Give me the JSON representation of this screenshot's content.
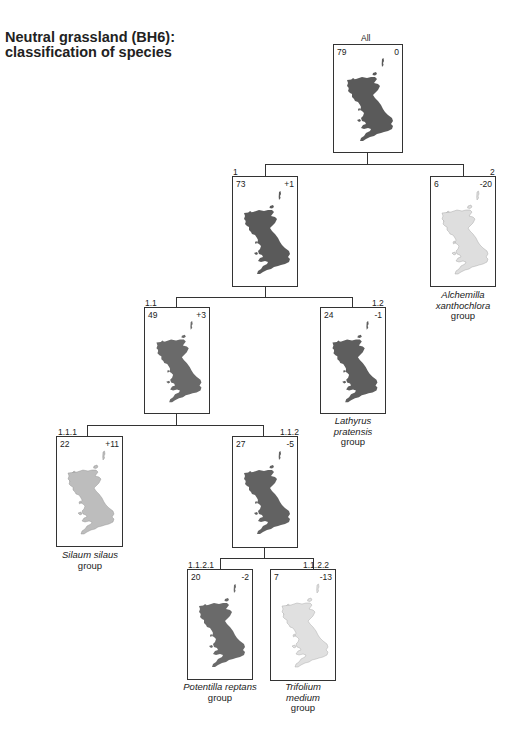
{
  "title": {
    "line1": "Neutral grassland (BH6):",
    "line2": "classification of species"
  },
  "colors": {
    "line": "#333333",
    "box_border": "#333333",
    "map_dark": "#5a5a5a",
    "map_medium": "#808080",
    "map_light": "#c8c8c8",
    "map_very_light": "#e2e2e2"
  },
  "nodes": [
    {
      "id": "All",
      "count": "79",
      "change": "0",
      "species": "",
      "group": "",
      "shade": "dark"
    },
    {
      "id": "1",
      "count": "73",
      "change": "+1",
      "species": "",
      "group": "",
      "shade": "dark"
    },
    {
      "id": "2",
      "count": "6",
      "change": "-20",
      "species": "Alchemilla xanthochlora",
      "species_line1": "Alchemilla",
      "species_line2": "xanthochlora",
      "group": "group",
      "shade": "very_light"
    },
    {
      "id": "1.1",
      "count": "49",
      "change": "+3",
      "species": "",
      "group": "",
      "shade": "medium"
    },
    {
      "id": "1.2",
      "count": "24",
      "change": "-1",
      "species": "Lathyrus pratensis",
      "species_line1": "Lathyrus",
      "species_line2": "pratensis",
      "group": "group",
      "shade": "dark"
    },
    {
      "id": "1.1.1",
      "count": "22",
      "change": "+11",
      "species": "Silaum silaus",
      "group": "group",
      "shade": "light"
    },
    {
      "id": "1.1.2",
      "count": "27",
      "change": "-5",
      "species": "",
      "group": "",
      "shade": "dark"
    },
    {
      "id": "1.1.2.1",
      "count": "20",
      "change": "-2",
      "species": "Potentilla reptans",
      "group": "group",
      "shade": "dark"
    },
    {
      "id": "1.1.2.2",
      "count": "7",
      "change": "-13",
      "species": "Trifolium",
      "species_line2": "medium",
      "group": "group",
      "shade": "very_light"
    }
  ]
}
